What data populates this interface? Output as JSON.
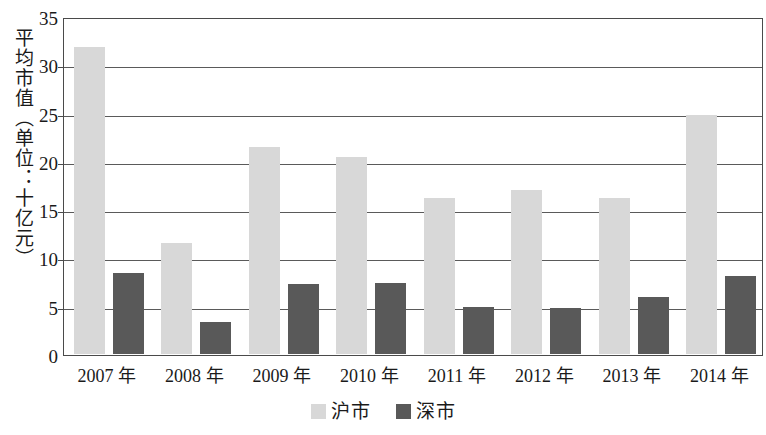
{
  "chart_data": {
    "type": "bar",
    "title": "",
    "xlabel": "",
    "ylabel": "平均市值（单位：十亿元）",
    "categories": [
      "2007 年",
      "2008 年",
      "2009 年",
      "2010 年",
      "2011 年",
      "2012 年",
      "2013 年",
      "2014 年"
    ],
    "series": [
      {
        "name": "沪市",
        "color": "#d8d8d8",
        "values": [
          31.8,
          11.5,
          21.4,
          20.4,
          16.2,
          17.0,
          16.2,
          24.8
        ]
      },
      {
        "name": "深市",
        "color": "#595959",
        "values": [
          8.4,
          3.3,
          7.2,
          7.4,
          4.9,
          4.8,
          5.9,
          8.1
        ]
      }
    ],
    "ylim": [
      0,
      35
    ],
    "yticks": [
      0,
      5,
      10,
      15,
      20,
      25,
      30,
      35
    ],
    "ytick_labels": [
      "0",
      "5",
      "10",
      "15",
      "20",
      "25",
      "30",
      "35"
    ],
    "grid": true,
    "legend_position": "bottom"
  },
  "legend": {
    "items": [
      {
        "label": "沪市",
        "swatch": "light"
      },
      {
        "label": "深市",
        "swatch": "dark"
      }
    ]
  }
}
